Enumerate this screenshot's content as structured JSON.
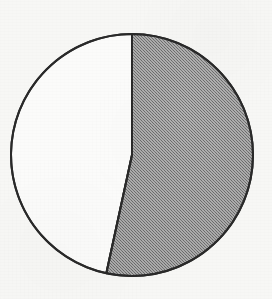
{
  "figure": {
    "kind": "pie-chart",
    "has_title": false,
    "has_legend": false,
    "has_labels": false,
    "background_color": "#f7f7f5",
    "outline_color": "#2a2a2a",
    "outline_width_px": 2,
    "center_x_px": 132,
    "center_y_px": 155,
    "radius_px": 121
  },
  "chart_data": {
    "type": "pie",
    "title": "",
    "xlabel": "",
    "ylabel": "",
    "grid": false,
    "legend_position": "none",
    "start_angle_deg": 0,
    "direction": "clockwise",
    "categories": [
      "Shaded segment",
      "Unshaded segment"
    ],
    "values": [
      53.4,
      46.6
    ],
    "units": "percent",
    "slices": [
      {
        "name": "Shaded segment",
        "value": 53.4,
        "angle_deg": 192.2,
        "start_angle_deg": 0,
        "end_angle_deg": 192.2,
        "fill": "#9a9a9a",
        "fill_style": "halftone-gray",
        "stroke": "#2a2a2a",
        "position": "right",
        "label": ""
      },
      {
        "name": "Unshaded segment",
        "value": 46.6,
        "angle_deg": 167.8,
        "start_angle_deg": 192.2,
        "end_angle_deg": 360,
        "fill": "#fbfbfa",
        "fill_style": "solid-white",
        "stroke": "#2a2a2a",
        "position": "left",
        "label": ""
      }
    ],
    "annotations": []
  }
}
